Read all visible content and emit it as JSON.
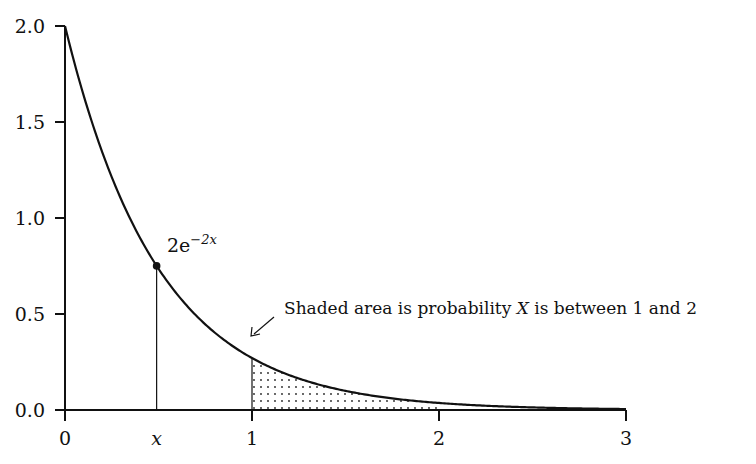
{
  "chart_data": {
    "type": "line",
    "title": "",
    "xlabel": "",
    "ylabel": "",
    "function_label": "2e^{-2x}",
    "function_label_base": "2e",
    "function_label_exp": "−2x",
    "xlim": [
      0,
      3
    ],
    "ylim": [
      0,
      2.0
    ],
    "grid": false,
    "legend": null,
    "x_ticks": [
      {
        "value": 0,
        "label": "0"
      },
      {
        "value": 0.49,
        "label": "x",
        "italic": true
      },
      {
        "value": 1,
        "label": "1"
      },
      {
        "value": 2,
        "label": "2"
      },
      {
        "value": 3,
        "label": "3"
      }
    ],
    "y_ticks": [
      {
        "value": 0.0,
        "label": "0.0"
      },
      {
        "value": 0.5,
        "label": "0.5"
      },
      {
        "value": 1.0,
        "label": "1.0"
      },
      {
        "value": 1.5,
        "label": "1.5"
      },
      {
        "value": 2.0,
        "label": "2.0"
      }
    ],
    "series": [
      {
        "name": "2e^{-2x}",
        "x": [
          0,
          0.25,
          0.5,
          0.75,
          1.0,
          1.25,
          1.5,
          1.75,
          2.0,
          2.25,
          2.5,
          2.75,
          3.0
        ],
        "values": [
          2.0,
          1.213,
          0.736,
          0.446,
          0.271,
          0.164,
          0.1,
          0.06,
          0.037,
          0.022,
          0.013,
          0.008,
          0.005
        ]
      }
    ],
    "marked_point": {
      "x": 0.49,
      "y": 0.75,
      "label": "x"
    },
    "shaded_region": {
      "from": 1,
      "to": 2,
      "pattern": "dots"
    },
    "annotations": [
      {
        "text_prefix": "Shaded area is probability ",
        "text_var": "X",
        "text_suffix": " is between 1 and 2",
        "arrow_to": {
          "x": 1,
          "y": 0.271
        }
      }
    ]
  }
}
